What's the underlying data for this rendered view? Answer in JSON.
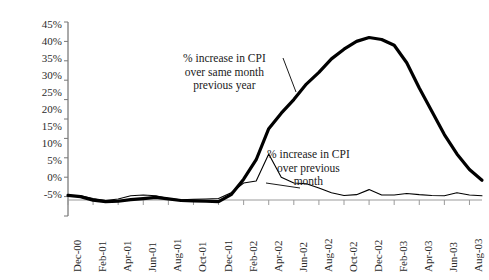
{
  "chart_data": {
    "type": "line",
    "title": "",
    "xlabel": "",
    "ylabel": "",
    "ylim": [
      -5,
      45
    ],
    "ytick_labels": [
      "45%",
      "40%",
      "35%",
      "30%",
      "25%",
      "20%",
      "15%",
      "10%",
      "5%",
      "0%",
      "-5%"
    ],
    "ytick_values": [
      45,
      40,
      35,
      30,
      25,
      20,
      15,
      10,
      5,
      0,
      -5
    ],
    "grid": false,
    "legend": "annotations",
    "x": [
      "Dec-00",
      "Jan-01",
      "Feb-01",
      "Mar-01",
      "Apr-01",
      "May-01",
      "Jun-01",
      "Jul-01",
      "Aug-01",
      "Sep-01",
      "Oct-01",
      "Nov-01",
      "Dec-01",
      "Jan-02",
      "Feb-02",
      "Mar-02",
      "Apr-02",
      "May-02",
      "Jun-02",
      "Jul-02",
      "Aug-02",
      "Sep-02",
      "Oct-02",
      "Nov-02",
      "Dec-02",
      "Jan-03",
      "Feb-03",
      "Mar-03",
      "Apr-03",
      "May-03",
      "Jun-03",
      "Jul-03",
      "Aug-03",
      "Sep-03"
    ],
    "xtick_labels": [
      "Dec-00",
      "Feb-01",
      "Apr-01",
      "Jun-01",
      "Aug-01",
      "Oct-01",
      "Dec-01",
      "Feb-02",
      "Apr-02",
      "Jun-02",
      "Aug-02",
      "Oct-02",
      "Dec-02",
      "Feb-03",
      "Apr-03",
      "Jun-03",
      "Aug-03"
    ],
    "xtick_indices": [
      0,
      2,
      4,
      6,
      8,
      10,
      12,
      14,
      16,
      18,
      20,
      22,
      24,
      26,
      28,
      30,
      32
    ],
    "series": [
      {
        "name": "% increase in CPI over same month previous year",
        "style": "thick",
        "color": "#000000",
        "width": 3.2,
        "values": [
          0.3,
          0.0,
          -0.9,
          -1.3,
          -1.2,
          -0.8,
          -0.5,
          -0.2,
          -0.6,
          -1.0,
          -1.1,
          -1.2,
          -1.3,
          0.5,
          4.5,
          9.5,
          17.5,
          21.5,
          25.0,
          29.0,
          32.0,
          35.5,
          38.0,
          40.0,
          41.0,
          40.5,
          39.0,
          34.5,
          28.0,
          22.0,
          16.0,
          11.0,
          7.0,
          4.2
        ]
      },
      {
        "name": "% increase in CPI over previous month",
        "style": "thin",
        "color": "#000000",
        "width": 1.1,
        "values": [
          0.3,
          0.2,
          -0.5,
          -1.0,
          -0.6,
          0.2,
          0.4,
          0.2,
          -0.5,
          -0.8,
          -0.7,
          -0.6,
          -0.5,
          1.0,
          3.5,
          4.0,
          11.0,
          5.0,
          3.5,
          3.3,
          2.2,
          1.0,
          0.3,
          0.5,
          1.8,
          0.4,
          0.4,
          0.8,
          0.5,
          0.3,
          0.2,
          1.0,
          0.4,
          0.2
        ]
      }
    ],
    "annotations": [
      {
        "name": "yoy-annotation",
        "lines": [
          "% increase in CPI",
          "over same month",
          "previous year"
        ],
        "x": 238,
        "y": 52
      },
      {
        "name": "mom-annotation",
        "lines": [
          "% increase in CPI",
          "over previous",
          "month"
        ],
        "x": 322,
        "y": 148
      }
    ]
  }
}
